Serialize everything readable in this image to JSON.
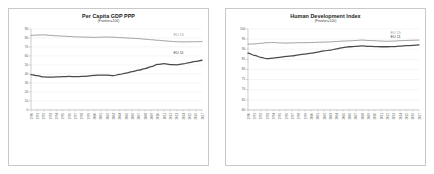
{
  "figure": {
    "panels": [
      {
        "id": "per-capita-gdp-ppp",
        "title": "Per Capita GDP PPP",
        "subtitle": "(Frontier=100)"
      },
      {
        "id": "human-development-index",
        "title": "Human Development Index",
        "subtitle": "(Frontier=100)"
      }
    ]
  },
  "colors": {
    "eu15": "#9b9b9b",
    "eu11": "#4a4a4a",
    "grid": "#e4e4e4",
    "axis": "#9a9a9a",
    "frame": "#c9c9c9",
    "background": "#ffffff"
  },
  "chart_data": [
    {
      "type": "line",
      "title": "Per Capita GDP PPP",
      "subtitle": "(Frontier=100)",
      "xlabel": "",
      "ylabel": "",
      "ylim": [
        0,
        90
      ],
      "yticks": [
        0,
        10,
        20,
        30,
        40,
        50,
        60,
        70,
        80,
        90
      ],
      "grid": true,
      "legend_position": "inline-right",
      "x": [
        "1990",
        "1991",
        "1992",
        "1993",
        "1994",
        "1995",
        "1996",
        "1997",
        "1998",
        "1999",
        "2000",
        "2001",
        "2002",
        "2003",
        "2004",
        "2005",
        "2006",
        "2007",
        "2008",
        "2009",
        "2010",
        "2011",
        "2012",
        "2013",
        "2014",
        "2015",
        "2016",
        "2017"
      ],
      "series": [
        {
          "name": "EU 15",
          "color": "#9b9b9b",
          "values": [
            82.8,
            83.2,
            83.4,
            82.9,
            82.4,
            82.0,
            81.6,
            81.2,
            81.0,
            80.8,
            80.6,
            80.9,
            81.0,
            80.8,
            80.4,
            80.0,
            79.6,
            79.2,
            78.6,
            78.0,
            77.4,
            76.8,
            76.2,
            75.8,
            75.6,
            75.7,
            75.8,
            76.0
          ]
        },
        {
          "name": "EU 11",
          "color": "#4a4a4a",
          "values": [
            39.2,
            38.0,
            36.6,
            36.4,
            36.6,
            37.0,
            37.2,
            37.0,
            37.2,
            37.6,
            38.4,
            38.8,
            38.6,
            38.2,
            39.4,
            41.0,
            42.6,
            44.2,
            46.0,
            48.0,
            50.6,
            51.4,
            50.4,
            50.2,
            51.2,
            52.6,
            54.0,
            55.2,
            57.6
          ]
        }
      ]
    },
    {
      "type": "line",
      "title": "Human Development Index",
      "subtitle": "(Frontier=100)",
      "xlabel": "",
      "ylabel": "",
      "ylim": [
        60,
        100
      ],
      "yticks": [
        60,
        65,
        70,
        75,
        80,
        85,
        90,
        95,
        100
      ],
      "grid": true,
      "legend_position": "inline-right",
      "x": [
        "1990",
        "1991",
        "1992",
        "1993",
        "1994",
        "1995",
        "1996",
        "1997",
        "1998",
        "1999",
        "2000",
        "2001",
        "2002",
        "2003",
        "2004",
        "2005",
        "2006",
        "2007",
        "2008",
        "2009",
        "2010",
        "2011",
        "2012",
        "2013",
        "2014",
        "2015",
        "2016",
        "2017"
      ],
      "series": [
        {
          "name": "EU 15",
          "color": "#9b9b9b",
          "values": [
            92.5,
            92.6,
            92.9,
            93.2,
            93.3,
            93.1,
            93.0,
            93.1,
            93.2,
            93.2,
            93.3,
            93.4,
            93.5,
            93.6,
            93.8,
            94.0,
            94.1,
            94.3,
            94.5,
            94.3,
            94.2,
            94.0,
            93.9,
            94.0,
            94.2,
            94.3,
            94.4,
            94.5
          ]
        },
        {
          "name": "EU 11",
          "color": "#4a4a4a",
          "values": [
            88.0,
            87.0,
            86.0,
            85.3,
            85.6,
            86.0,
            86.4,
            86.7,
            87.2,
            87.6,
            88.0,
            88.6,
            89.2,
            89.5,
            90.2,
            90.8,
            91.2,
            91.4,
            91.6,
            91.4,
            91.3,
            91.2,
            91.2,
            91.3,
            91.5,
            91.7,
            91.9,
            92.1
          ]
        }
      ]
    }
  ]
}
